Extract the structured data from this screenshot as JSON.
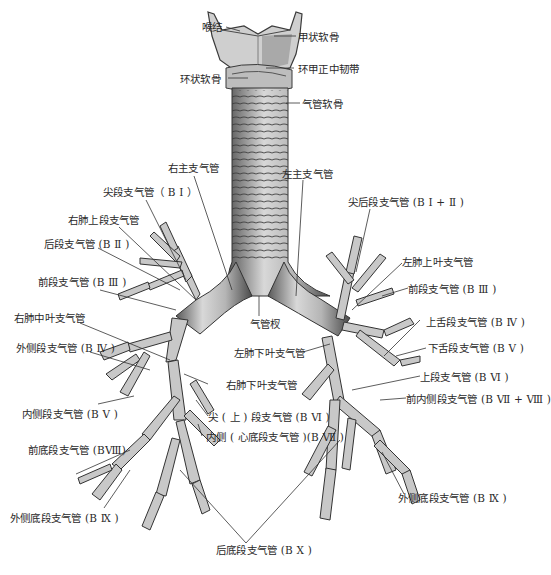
{
  "figure": {
    "colors": {
      "ink": "#2a2a2a",
      "tissue_light": "#d9d9d9",
      "tissue_mid": "#9a9a9a",
      "tissue_dark": "#4a4a4a",
      "background": "#ffffff"
    }
  },
  "labels": {
    "laryngeal_prominence": "喉结",
    "thyroid_cartilage": "甲状软骨",
    "cricoid_cartilage": "环状软骨",
    "median_cricothyroid_ligament": "环甲正中韧带",
    "tracheal_cartilage": "气管软骨",
    "right_main_bronchus": "右主支气管",
    "left_main_bronchus": "左主支气管",
    "apical_segmental_r": "尖段支气管（ B Ⅰ ）",
    "right_upper_lobe_bronchus": "右肺上段支气管",
    "posterior_segmental_r": "后段支气管 (B Ⅱ )",
    "anterior_segmental_r": "前段支气管 (B Ⅲ )",
    "right_middle_lobe_bronchus": "右肺中叶支气管",
    "lateral_segmental_r": "外侧段支气管 (B Ⅳ )",
    "medial_segmental_r": "内侧段支气管 (B Ⅴ )",
    "anterior_basal_r": "前底段支气管 (BⅧ)",
    "lateral_basal_r": "外侧底段支气管 (B Ⅸ )",
    "posterior_basal": "后底段支气管 (B Ⅹ )",
    "apicoposterior_l": "尖后段支气管 (B Ⅰ + Ⅱ )",
    "left_upper_lobe_bronchus": "左肺上叶支气管",
    "anterior_segmental_l": "前段支气管 (B Ⅲ )",
    "carina": "气管杈",
    "superior_lingular": "上舌段支气管 (B Ⅳ )",
    "inferior_lingular": "下舌段支气管 (B Ⅴ )",
    "left_lower_lobe_bronchus": "左肺下叶支气管",
    "superior_segmental_l": "上段支气管 (B Ⅵ )",
    "anteromedial_basal_l": "前内侧段支气管 (B Ⅶ + Ⅷ )",
    "right_lower_lobe_bronchus": "右肺下叶支气管",
    "superior_segmental_r": "尖 ( 上 ) 段支气管 (B Ⅵ )",
    "medial_basal_r": "内侧 ( 心底段支气管 )(B Ⅶ )",
    "lateral_basal_l": "外侧底段支气管 (B Ⅸ )"
  }
}
